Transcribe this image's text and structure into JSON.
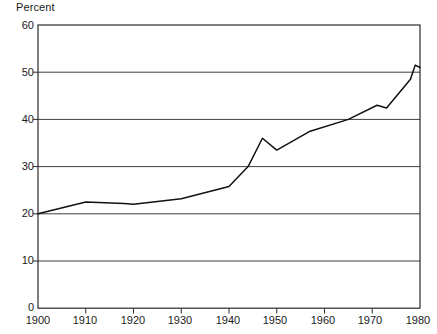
{
  "chart_data": {
    "type": "line",
    "title": "",
    "subtitle": "",
    "xlabel": "",
    "ylabel": "Percent",
    "ylim": [
      0,
      60
    ],
    "xlim": [
      1900,
      1980
    ],
    "grid": "horizontal",
    "legend": "none",
    "line_color": "#111111",
    "background_color": "#ffffff",
    "yticks": [
      60,
      50,
      40,
      30,
      20,
      10,
      0
    ],
    "ytick_labels": [
      "60",
      "50",
      "40",
      "30",
      "20",
      "10",
      "0"
    ],
    "xticks": [
      1900,
      1910,
      1920,
      1930,
      1940,
      1950,
      1960,
      1970,
      1980
    ],
    "xtick_labels": [
      "1900",
      "1910",
      "1920",
      "1930",
      "1940",
      "1950",
      "1960",
      "1970",
      "1980"
    ],
    "series": [
      {
        "name": "Percent",
        "x": [
          1900,
          1910,
          1918,
          1920,
          1930,
          1940,
          1944,
          1947,
          1950,
          1957,
          1965,
          1971,
          1973,
          1978,
          1979,
          1980
        ],
        "values": [
          20.0,
          22.5,
          22.2,
          22.0,
          23.2,
          25.8,
          30.0,
          36.0,
          33.5,
          37.5,
          40.0,
          43.0,
          42.4,
          48.5,
          51.5,
          51.0
        ]
      }
    ]
  }
}
